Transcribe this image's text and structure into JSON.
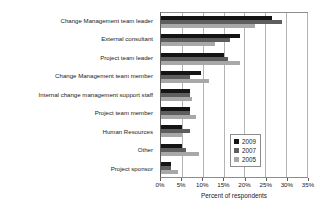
{
  "chart_data": {
    "type": "bar",
    "orientation": "horizontal",
    "title": "",
    "xlabel": "Percent of respondents",
    "ylabel": "",
    "xlim": [
      0,
      35
    ],
    "xtick_labels": [
      "0%",
      "5%",
      "10%",
      "15%",
      "20%",
      "25%",
      "30%",
      "35%"
    ],
    "xtick_values": [
      0,
      5,
      10,
      15,
      20,
      25,
      30,
      35
    ],
    "grid": true,
    "legend_position": "lower-right",
    "categories": [
      "Change Management team leader",
      "External consultant",
      "Project team leader",
      "Change Management team member",
      "Internal change management support staff",
      "Project team member",
      "Human Resources",
      "Other",
      "Project sponsor"
    ],
    "series": [
      {
        "name": "2009",
        "color": "#141414",
        "values": [
          26.5,
          19.0,
          15.0,
          9.5,
          7.0,
          7.0,
          5.0,
          5.0,
          2.5
        ]
      },
      {
        "name": "2007",
        "color": "#5e5e5e",
        "values": [
          29.0,
          16.5,
          16.0,
          7.0,
          7.0,
          7.0,
          7.0,
          6.0,
          2.5
        ]
      },
      {
        "name": "2005",
        "color": "#a8a8a8",
        "values": [
          22.5,
          13.0,
          19.0,
          11.5,
          7.5,
          8.5,
          5.0,
          9.0,
          4.0
        ]
      }
    ]
  }
}
